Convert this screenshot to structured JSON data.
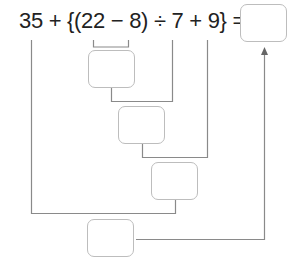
{
  "equation": {
    "text": "35 + {(22 − 8) ÷ 7 + 9} =",
    "tokens": [
      "35",
      "+",
      "{",
      "(",
      "22",
      "−",
      "8",
      ")",
      "÷",
      "7",
      "+",
      "9",
      "}",
      "="
    ]
  },
  "answer_boxes": [
    {
      "id": "final-answer",
      "value": ""
    },
    {
      "id": "step-1-subtraction",
      "value": ""
    },
    {
      "id": "step-2-division",
      "value": ""
    },
    {
      "id": "step-3-addition",
      "value": ""
    },
    {
      "id": "step-4-addition",
      "value": ""
    }
  ],
  "colors": {
    "text": "#222222",
    "line": "#8a8a8a",
    "box_border": "#bdbdbd"
  }
}
